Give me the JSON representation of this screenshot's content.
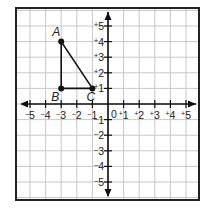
{
  "chart_data": {
    "type": "scatter",
    "title": "",
    "xlabel": "",
    "ylabel": "",
    "xlim": [
      -5.5,
      5.5
    ],
    "ylim": [
      -5.5,
      5.5
    ],
    "grid": true,
    "x_tick_labels": [
      "-5",
      "-4",
      "-3",
      "-2",
      "-1",
      "0",
      "+1",
      "+2",
      "+3",
      "+4",
      "+5"
    ],
    "y_tick_labels": [
      "+5",
      "+4",
      "+3",
      "+2",
      "+1",
      "0",
      "-1",
      "-2",
      "-3",
      "-4",
      "-5"
    ],
    "points": [
      {
        "label": "A",
        "x": -3,
        "y": 4
      },
      {
        "label": "B",
        "x": -3,
        "y": 1
      },
      {
        "label": "C",
        "x": -1,
        "y": 1
      }
    ],
    "shape": {
      "type": "triangle",
      "vertices": [
        "A",
        "B",
        "C"
      ]
    }
  },
  "diagram": {
    "origin_label": "0",
    "x_labels": [
      {
        "text": "5",
        "sign": "-",
        "v": -5
      },
      {
        "text": "4",
        "sign": "-",
        "v": -4
      },
      {
        "text": "3",
        "sign": "-",
        "v": -3
      },
      {
        "text": "2",
        "sign": "-",
        "v": -2
      },
      {
        "text": "1",
        "sign": "-",
        "v": -1
      },
      {
        "text": "1",
        "sign": "+",
        "v": 1
      },
      {
        "text": "2",
        "sign": "+",
        "v": 2
      },
      {
        "text": "3",
        "sign": "+",
        "v": 3
      },
      {
        "text": "4",
        "sign": "+",
        "v": 4
      },
      {
        "text": "5",
        "sign": "+",
        "v": 5
      }
    ],
    "y_labels": [
      {
        "text": "5",
        "sign": "+",
        "v": 5
      },
      {
        "text": "4",
        "sign": "+",
        "v": 4
      },
      {
        "text": "3",
        "sign": "+",
        "v": 3
      },
      {
        "text": "2",
        "sign": "+",
        "v": 2
      },
      {
        "text": "1",
        "sign": "+",
        "v": 1
      },
      {
        "text": "1",
        "sign": "-",
        "v": -1
      },
      {
        "text": "2",
        "sign": "-",
        "v": -2
      },
      {
        "text": "3",
        "sign": "-",
        "v": -3
      },
      {
        "text": "4",
        "sign": "-",
        "v": -4
      },
      {
        "text": "5",
        "sign": "-",
        "v": -5
      }
    ],
    "point_labels": {
      "A": "A",
      "B": "B",
      "C": "C"
    },
    "colors": {
      "grid": "#c8c8c8",
      "axis": "#111111",
      "frame": "#222222",
      "shape": "#111111"
    }
  }
}
